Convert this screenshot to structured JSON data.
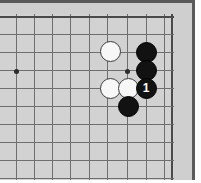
{
  "board": {
    "label": "go-board-diagram",
    "background_color": "#d2d2d2",
    "frame_color": "#c9c9c9",
    "edge_color": "#5a5a5a",
    "line_color": "#6f6f6f",
    "boundary_line_color": "#4a4a4a",
    "grid_spacing_px": 18,
    "origin_x_px": 16,
    "origin_y_px": 71,
    "vertical_lines_x": [
      16,
      34,
      52,
      70,
      89,
      107,
      127,
      146,
      164
    ],
    "horizontal_lines_y": [
      16,
      34,
      52,
      70,
      88,
      106,
      124,
      142,
      160,
      178
    ],
    "boundary_top_y": 16,
    "boundary_right_x": 171
  },
  "hoshi_points": [
    {
      "name": "star-point-left",
      "x": 16,
      "y": 71
    },
    {
      "name": "star-point-center",
      "x": 127,
      "y": 71
    }
  ],
  "stones": [
    {
      "name": "white-stone-1",
      "color": "white",
      "x": 110,
      "y": 51,
      "move_number": ""
    },
    {
      "name": "black-stone-1",
      "color": "black",
      "x": 146,
      "y": 52,
      "move_number": ""
    },
    {
      "name": "black-stone-2",
      "color": "black",
      "x": 146,
      "y": 70,
      "move_number": ""
    },
    {
      "name": "white-stone-2",
      "color": "white",
      "x": 110,
      "y": 88,
      "move_number": ""
    },
    {
      "name": "white-stone-3",
      "color": "white",
      "x": 128,
      "y": 88,
      "move_number": ""
    },
    {
      "name": "black-stone-move-1",
      "color": "black",
      "x": 146,
      "y": 88,
      "move_number": "1"
    },
    {
      "name": "black-stone-3",
      "color": "black",
      "x": 128,
      "y": 106,
      "move_number": ""
    }
  ],
  "colors": {
    "black_stone": "#121212",
    "white_stone": "#f7f7f7",
    "move_number_on_black": "#ffffff"
  }
}
